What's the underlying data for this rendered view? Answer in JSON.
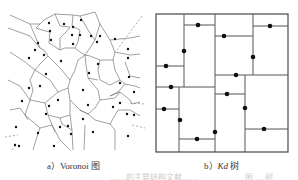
{
  "panels": [
    {
      "id": "voronoi",
      "caption_prefix": "a）",
      "caption_main": "Voronoi 图",
      "description": "Voronoi diagram of scattered seed points"
    },
    {
      "id": "kdtree",
      "caption_prefix": "b）",
      "caption_italic": "Kd",
      "caption_main": " 树",
      "description": "Kd-tree spatial partition with points on splitting lines"
    }
  ],
  "colors": {
    "line": "#666666",
    "point": "#111111",
    "border": "#555555",
    "background": "#ffffff"
  },
  "footer_faint": {
    "left": "……的主要结构文献……",
    "right": "图 … 树"
  }
}
